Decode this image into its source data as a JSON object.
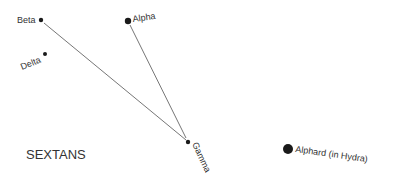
{
  "diagram": {
    "title": "SEXTANS",
    "stars": [
      {
        "id": "beta",
        "label": "Beta",
        "x": 41,
        "y": 20,
        "r": 2.2
      },
      {
        "id": "alpha",
        "label": "Alpha",
        "x": 128,
        "y": 21,
        "r": 3.2
      },
      {
        "id": "delta",
        "label": "Delta",
        "x": 45,
        "y": 54,
        "r": 2.0
      },
      {
        "id": "gamma",
        "label": "Gamma",
        "x": 188,
        "y": 142,
        "r": 2.2
      },
      {
        "id": "alphard",
        "label": "Alphard (in Hydra)",
        "x": 288,
        "y": 149,
        "r": 5.0
      }
    ],
    "lines": [
      {
        "from": "beta",
        "to": "gamma"
      },
      {
        "from": "alpha",
        "to": "gamma"
      }
    ],
    "colors": {
      "star": "#1a1a1a",
      "line": "#555555",
      "text": "#333333"
    }
  }
}
